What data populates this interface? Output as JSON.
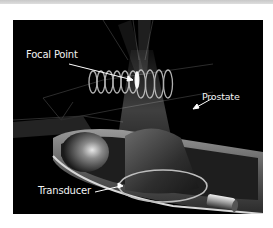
{
  "figure": {
    "labels": {
      "focal_point": "Focal Point",
      "prostate": "Prostate",
      "transducer": "Transducer"
    },
    "colors": {
      "background": "#000000",
      "label_text": "#f2f2f2",
      "frame": "#ffffff",
      "top_bar": "#cfcfcf"
    }
  }
}
